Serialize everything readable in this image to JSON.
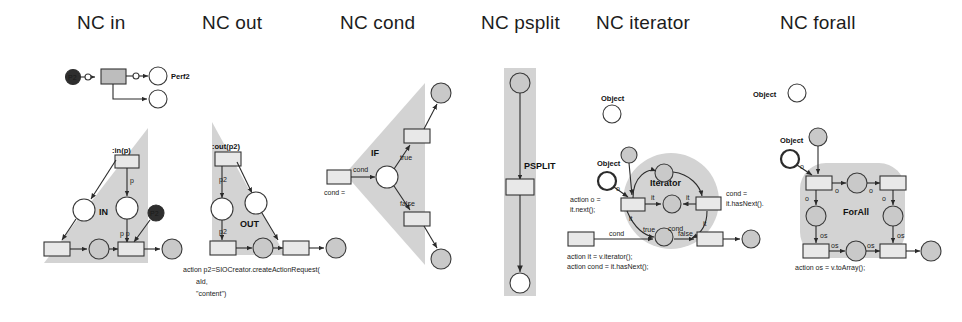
{
  "figure": {
    "background": "#ffffff",
    "region_color": "#d3d3d3",
    "panel_count": 6
  },
  "panels": [
    {
      "id": "nc-in",
      "title": "NC in",
      "region_shape": "triangle-right",
      "labels": {
        "transition_top": ":in(p)",
        "region_name": "IN",
        "arc_p": "p",
        "arc_pp": "p p",
        "token_p2": "P2"
      },
      "example_net": {
        "start_place": "P2",
        "arc_in": "p",
        "arc_out": "p",
        "end_place": "Perf2"
      },
      "caption": ""
    },
    {
      "id": "nc-out",
      "title": "NC out",
      "region_shape": "triangle-right",
      "labels": {
        "transition_top": ":out(p2)",
        "region_name": "OUT",
        "arc_p2_upper": "p2",
        "arc_p2_lower": "p2"
      },
      "caption_lines": [
        "action p2=SIOCreator.createActionRequest(",
        "aId,",
        "\"content\")"
      ]
    },
    {
      "id": "nc-cond",
      "title": "NC cond",
      "region_shape": "triangle-left",
      "labels": {
        "region_name": "IF",
        "arc_cond": "cond",
        "arc_true": "true",
        "arc_false": "false",
        "box_cond": "cond ="
      },
      "caption": ""
    },
    {
      "id": "nc-psplit",
      "title": "NC psplit",
      "region_shape": "vertical-band",
      "labels": {
        "region_name": "PSPLIT"
      },
      "caption": ""
    },
    {
      "id": "nc-iterator",
      "title": "NC iterator",
      "region_shape": "circle",
      "labels": {
        "region_name": "Iterator",
        "legend_object": "Object",
        "object_node": "Object",
        "action_o": "action o =",
        "action_o2": "it.next();",
        "cond_label": "cond =",
        "cond_label2": "it.hasNext().",
        "arc_true": "true",
        "arc_cond": "cond",
        "arc_false": "false",
        "arc_cond_left": "cond",
        "arc_it_1": "it",
        "arc_it_2": "it",
        "arc_it_3": "it",
        "arc_it_4": "it",
        "arc_o": "o"
      },
      "caption_lines": [
        "action it = v.iterator();",
        "action cond =  it.hasNext();"
      ]
    },
    {
      "id": "nc-forall",
      "title": "NC forall",
      "region_shape": "rounded-blob",
      "labels": {
        "region_name": "ForAll",
        "legend_object": "Object",
        "object_node": "Object",
        "arc_o_1": "o",
        "arc_o_2": "o",
        "arc_o_3": "o",
        "arc_o_4": "o",
        "arc_o_5": "o",
        "arc_os_1": "os",
        "arc_os_2": "os",
        "arc_os_3": "os",
        "arc_os_4": "os"
      },
      "caption_lines": [
        "action os = v.toArray();"
      ]
    }
  ]
}
